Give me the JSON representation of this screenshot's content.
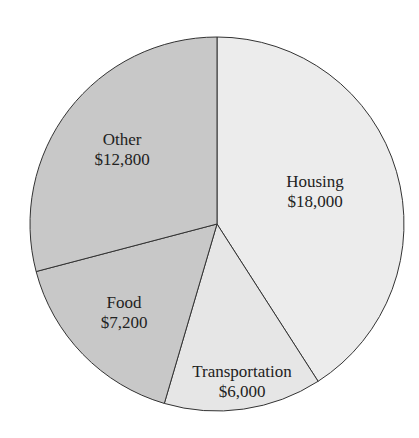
{
  "chart_data": {
    "type": "pie",
    "title": "",
    "categories": [
      "Housing",
      "Transportation",
      "Food",
      "Other"
    ],
    "values": [
      18000,
      6000,
      7200,
      12800
    ],
    "labels": [
      "$18,000",
      "$6,000",
      "$7,200",
      "$12,800"
    ],
    "colors": [
      "#ececec",
      "#e6e6e6",
      "#c8c8c8",
      "#c8c8c8"
    ],
    "start_angle_deg": 0,
    "direction": "clockwise",
    "legend": "none",
    "total": 44000
  },
  "slices": [
    {
      "name": "Housing",
      "amount": "$18,000"
    },
    {
      "name": "Transportation",
      "amount": "$6,000"
    },
    {
      "name": "Food",
      "amount": "$7,200"
    },
    {
      "name": "Other",
      "amount": "$12,800"
    }
  ]
}
